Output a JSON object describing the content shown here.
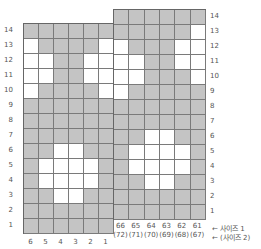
{
  "chart_data": {
    "type": "diagram",
    "title": "",
    "colors": {
      "filled": "#c4c4c4",
      "empty": "#ffffff",
      "grid_line": "#7a7a7a"
    },
    "left_section": {
      "column_labels": [
        "6",
        "5",
        "4",
        "3",
        "2",
        "1"
      ],
      "row_labels": [
        "14",
        "13",
        "12",
        "11",
        "10",
        "9",
        "8",
        "7",
        "6",
        "5",
        "4",
        "3",
        "2",
        "1"
      ],
      "rows": [
        "GGGGGG",
        "WGGGGW",
        "WWGGWW",
        "WWGGWW",
        "WGGGGW",
        "GGGGGG",
        "GGGGGG",
        "GGGGGG",
        "GGWWGG",
        "GWWWWG",
        "GWWWWG",
        "GGWWGG",
        "GGGGGG",
        "GGGGGG"
      ]
    },
    "right_section": {
      "column_labels_size1": [
        "66",
        "65",
        "64",
        "63",
        "62",
        "61"
      ],
      "column_labels_size2": [
        "(72)",
        "(71)",
        "(70)",
        "(69)",
        "(68)",
        "(67)"
      ],
      "row_labels": [
        "14",
        "13",
        "12",
        "11",
        "10",
        "9",
        "8",
        "7",
        "6",
        "5",
        "4",
        "3",
        "2",
        "1"
      ],
      "rows": [
        "GGGGGG",
        "GGGGGW",
        "WGGGWW",
        "WWGGWW",
        "WWGGGW",
        "WGGGGG",
        "GGGGGG",
        "GGGGGG",
        "GGWWGG",
        "GWWWWG",
        "GWWWWG",
        "GGWWGG",
        "GGGGGG",
        "GGGGGG"
      ]
    },
    "legend": {
      "size1": "← 사이즈 1",
      "size2": "← (사이즈 2)"
    }
  }
}
